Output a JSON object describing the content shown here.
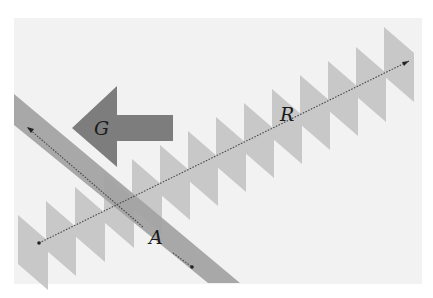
{
  "diagram": {
    "background": {
      "color": "#f2f2f2",
      "x": 14,
      "y": 18,
      "width": 408,
      "height": 266
    },
    "colors": {
      "parallelogram": "#c8c8c8",
      "band": "#a3a3a3",
      "band_overlap": "#9a9a9a",
      "arrow": "#7d7d7d",
      "dotted_line": "#444444"
    },
    "labels": {
      "arrow_label": "G",
      "series_label": "R",
      "band_label": "A"
    },
    "shapes": {
      "parallelogram_count": 14,
      "band_direction": "diagonal top-left to bottom-right",
      "arrow_direction": "left"
    }
  }
}
